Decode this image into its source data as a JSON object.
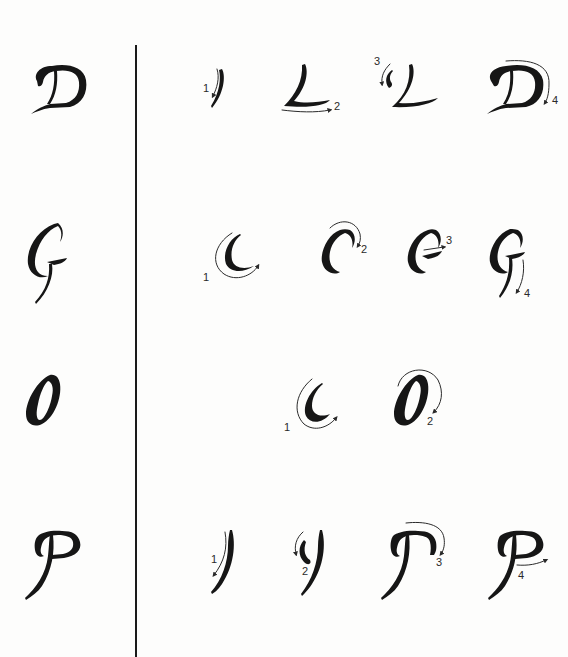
{
  "diagram": {
    "type": "calligraphy-stroke-order",
    "colors": {
      "ink": "#161616",
      "paper": "#fdfdfc",
      "divider": "#1a1a1a"
    },
    "rows": [
      {
        "letter": "D",
        "finished_label": "D",
        "steps": [
          {
            "number": "1",
            "description": "downstroke stem"
          },
          {
            "number": "2",
            "description": "base stroke to the right"
          },
          {
            "number": "3",
            "description": "hooked entry at top-left"
          },
          {
            "number": "4",
            "description": "bowl arch over top and down right side"
          }
        ]
      },
      {
        "letter": "G",
        "finished_label": "G",
        "steps": [
          {
            "number": "1",
            "description": "left crescent curve"
          },
          {
            "number": "2",
            "description": "top arch to the right"
          },
          {
            "number": "3",
            "description": "crossbar to the right"
          },
          {
            "number": "4",
            "description": "descender stroke downward"
          }
        ]
      },
      {
        "letter": "O",
        "finished_label": "O",
        "steps": [
          {
            "number": "1",
            "description": "left crescent curve"
          },
          {
            "number": "2",
            "description": "right side closing curve"
          }
        ]
      },
      {
        "letter": "P",
        "finished_label": "P",
        "steps": [
          {
            "number": "1",
            "description": "long downstroke stem"
          },
          {
            "number": "2",
            "description": "hooked entry at top-left"
          },
          {
            "number": "3",
            "description": "top arch over to the right"
          },
          {
            "number": "4",
            "description": "bowl closing stroke to the right"
          }
        ]
      }
    ]
  }
}
